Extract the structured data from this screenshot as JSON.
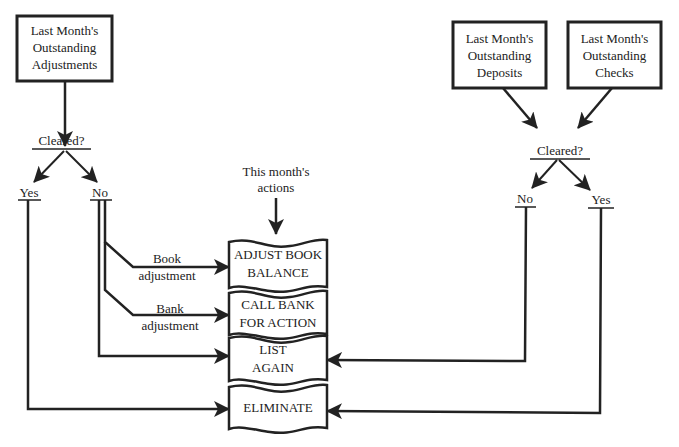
{
  "diagram": {
    "type": "flowchart",
    "colors": {
      "ink": "#222222",
      "background": "#ffffff"
    },
    "sources": {
      "adjustments": {
        "lines": [
          "Last Month's",
          "Outstanding",
          "Adjustments"
        ]
      },
      "deposits": {
        "lines": [
          "Last Month's",
          "Outstanding",
          "Deposits"
        ]
      },
      "checks": {
        "lines": [
          "Last Month's",
          "Outstanding",
          "Checks"
        ]
      }
    },
    "left_decision": {
      "label": "Cleared?",
      "yes": "Yes",
      "no": "No"
    },
    "right_decision": {
      "label": "Cleared?",
      "yes": "Yes",
      "no": "No"
    },
    "this_month": {
      "lines": [
        "This month's",
        "actions"
      ]
    },
    "branch_labels": {
      "book": [
        "Book",
        "adjustment"
      ],
      "bank": [
        "Bank",
        "adjustment"
      ]
    },
    "actions": [
      {
        "lines": [
          "ADJUST BOOK",
          "BALANCE"
        ]
      },
      {
        "lines": [
          "CALL BANK",
          "FOR ACTION"
        ]
      },
      {
        "lines": [
          "LIST",
          "AGAIN"
        ]
      },
      {
        "lines": [
          "ELIMINATE"
        ]
      }
    ],
    "edges": [
      {
        "from": "Last Month's Outstanding Adjustments",
        "to": "Cleared? (left)"
      },
      {
        "from": "Cleared? (left)",
        "to": "Yes (left)"
      },
      {
        "from": "Cleared? (left)",
        "to": "No (left)"
      },
      {
        "from": "No (left)",
        "to": "ADJUST BOOK BALANCE",
        "label": "Book adjustment"
      },
      {
        "from": "No (left)",
        "to": "CALL BANK FOR ACTION",
        "label": "Bank adjustment"
      },
      {
        "from": "No (left)",
        "to": "LIST AGAIN"
      },
      {
        "from": "Yes (left)",
        "to": "ELIMINATE"
      },
      {
        "from": "This month's actions",
        "to": "ADJUST BOOK BALANCE"
      },
      {
        "from": "Last Month's Outstanding Deposits",
        "to": "Cleared? (right)"
      },
      {
        "from": "Last Month's Outstanding Checks",
        "to": "Cleared? (right)"
      },
      {
        "from": "Cleared? (right)",
        "to": "No (right)"
      },
      {
        "from": "Cleared? (right)",
        "to": "Yes (right)"
      },
      {
        "from": "No (right)",
        "to": "LIST AGAIN"
      },
      {
        "from": "Yes (right)",
        "to": "ELIMINATE"
      }
    ]
  }
}
